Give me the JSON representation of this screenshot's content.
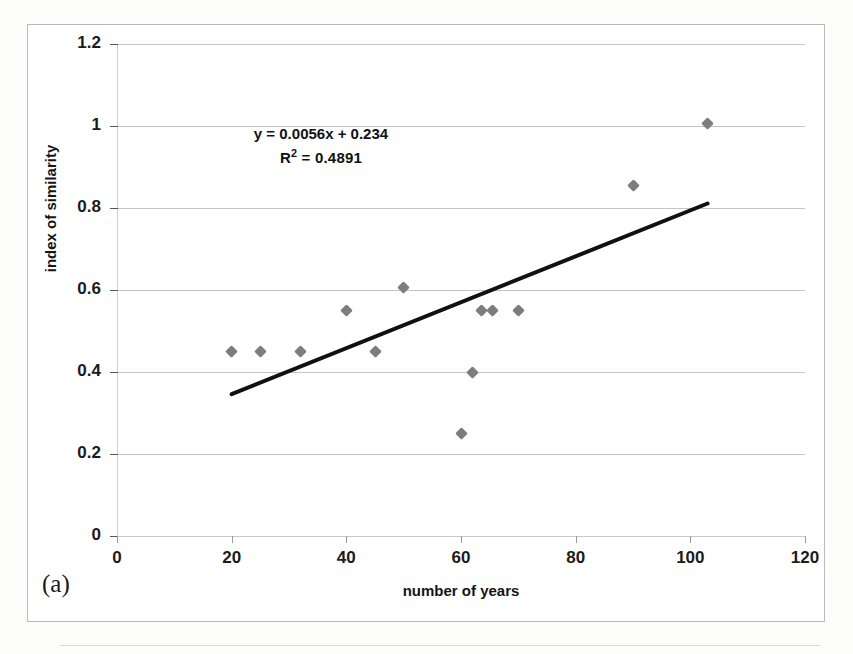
{
  "figure": {
    "subfigure_label": "(a)"
  },
  "annotation": {
    "equation": "y = 0.0056x + 0.234",
    "r_squared_prefix": "R",
    "r_squared_exponent": "2",
    "r_squared_value": " = 0.4891",
    "r_squared_full": "R² = 0.4891"
  },
  "colors": {
    "marker": "#7d7d7d",
    "trendline": "#111111",
    "gridline": "#c4c4c4",
    "text": "#141414"
  },
  "chart_data": {
    "type": "scatter",
    "title": "",
    "subtitle": "",
    "xlabel": "number of years",
    "ylabel": "index of similarity",
    "xlim": [
      0,
      120
    ],
    "ylim": [
      0,
      1.2
    ],
    "xticks": [
      0,
      20,
      40,
      60,
      80,
      100,
      120
    ],
    "yticks": [
      0,
      0.2,
      0.4,
      0.6,
      0.8,
      1,
      1.2
    ],
    "xtick_labels": [
      "0",
      "20",
      "40",
      "60",
      "80",
      "100",
      "120"
    ],
    "ytick_labels": [
      "0",
      "0.2",
      "0.4",
      "0.6",
      "0.8",
      "1",
      "1.2"
    ],
    "grid": "horizontal",
    "legend": "none",
    "series": [
      {
        "name": "index of similarity",
        "marker": "diamond",
        "color": "#7d7d7d",
        "points": [
          {
            "x": 20,
            "y": 0.45
          },
          {
            "x": 25,
            "y": 0.45
          },
          {
            "x": 32,
            "y": 0.45
          },
          {
            "x": 40,
            "y": 0.55
          },
          {
            "x": 45,
            "y": 0.45
          },
          {
            "x": 50,
            "y": 0.605
          },
          {
            "x": 60,
            "y": 0.25
          },
          {
            "x": 62,
            "y": 0.4
          },
          {
            "x": 63.5,
            "y": 0.55
          },
          {
            "x": 65.5,
            "y": 0.55
          },
          {
            "x": 70,
            "y": 0.55
          },
          {
            "x": 90,
            "y": 0.855
          },
          {
            "x": 103,
            "y": 1.005
          }
        ]
      }
    ],
    "trendline": {
      "type": "linear",
      "equation": "y = 0.0056x + 0.234",
      "slope": 0.0056,
      "intercept": 0.234,
      "r_squared": 0.4891,
      "x_start": 20,
      "x_end": 103,
      "y_start": 0.346,
      "y_end": 0.811
    }
  }
}
